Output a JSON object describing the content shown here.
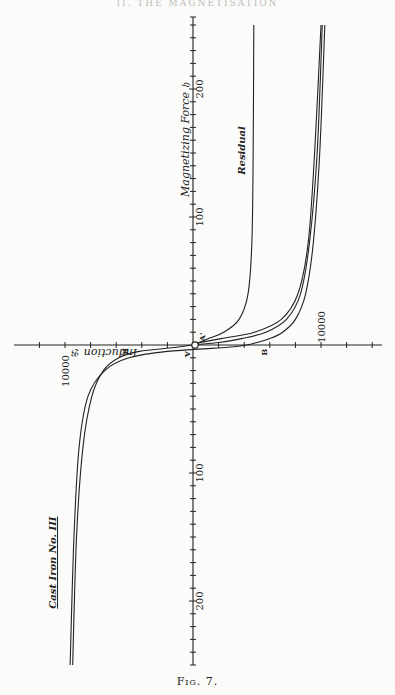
{
  "page": {
    "running_head": "II. THE MAGNETISATION",
    "caption": "Fig. 7."
  },
  "chart_data": {
    "type": "line",
    "title": "Cast Iron No. III",
    "xlabel": "Induction 𝔅",
    "ylabel": "Magnetizing Force 𝔥",
    "orientation": "rotated 90°: magnetizing force runs along the vertical axis (positive upward), induction along the horizontal axis (positive to the right)",
    "x_axis": {
      "name": "Induction 𝔅",
      "range": [
        -14000,
        14000
      ],
      "tick_step": 2000,
      "tick_labels": [
        {
          "value": -10000,
          "text": "10000"
        },
        {
          "value": 10000,
          "text": "10000"
        }
      ]
    },
    "y_axis": {
      "name": "Magnetizing Force 𝔥",
      "range": [
        -250,
        255
      ],
      "tick_step": 10,
      "tick_labels": [
        {
          "value": 200,
          "text": "200"
        },
        {
          "value": 100,
          "text": "100"
        },
        {
          "value": -100,
          "text": "100"
        },
        {
          "value": -200,
          "text": "200"
        }
      ]
    },
    "point_labels": [
      {
        "text": "A",
        "h": -2,
        "b": 0
      },
      {
        "text": "A'",
        "h": 2,
        "b": 0
      },
      {
        "text": "B",
        "h": 0,
        "b": -5600
      },
      {
        "text": "B",
        "h": 0,
        "b": 5600
      },
      {
        "text": "O",
        "h": 0,
        "b": 0
      }
    ],
    "series": [
      {
        "name": "Hysteresis loop (ascending branch)",
        "points": [
          [
            -250,
            -9400
          ],
          [
            -150,
            -9100
          ],
          [
            -80,
            -8600
          ],
          [
            -40,
            -7900
          ],
          [
            -20,
            -7000
          ],
          [
            -10,
            -5800
          ],
          [
            -5,
            -4200
          ],
          [
            -2,
            -1500
          ],
          [
            0,
            0
          ],
          [
            2,
            2000
          ],
          [
            5,
            3800
          ],
          [
            10,
            5700
          ],
          [
            20,
            7300
          ],
          [
            40,
            8400
          ],
          [
            80,
            9100
          ],
          [
            150,
            9700
          ],
          [
            250,
            10100
          ]
        ]
      },
      {
        "name": "Hysteresis loop (descending branch)",
        "points": [
          [
            250,
            10300
          ],
          [
            150,
            9900
          ],
          [
            80,
            9400
          ],
          [
            40,
            8800
          ],
          [
            20,
            8000
          ],
          [
            10,
            7000
          ],
          [
            5,
            6000
          ],
          [
            2,
            5000
          ],
          [
            0,
            4200
          ],
          [
            -2,
            2500
          ],
          [
            -5,
            -2000
          ],
          [
            -10,
            -5000
          ],
          [
            -20,
            -6900
          ],
          [
            -40,
            -8200
          ],
          [
            -80,
            -8900
          ],
          [
            -150,
            -9300
          ],
          [
            -250,
            -9600
          ]
        ]
      },
      {
        "name": "Initial magnetization curve",
        "points": [
          [
            0,
            0
          ],
          [
            2,
            600
          ],
          [
            5,
            2200
          ],
          [
            10,
            4800
          ],
          [
            20,
            6900
          ],
          [
            40,
            8200
          ],
          [
            80,
            9000
          ],
          [
            150,
            9500
          ],
          [
            250,
            10000
          ]
        ]
      },
      {
        "name": "Residual",
        "points": [
          [
            0,
            0
          ],
          [
            5,
            1200
          ],
          [
            10,
            2400
          ],
          [
            20,
            3600
          ],
          [
            40,
            4300
          ],
          [
            80,
            4600
          ],
          [
            150,
            4700
          ],
          [
            250,
            4750
          ]
        ]
      }
    ],
    "annotations": [
      {
        "text": "Residual",
        "near": "residual curve, h≈130"
      },
      {
        "text": "Cast Iron No. III",
        "near": "lower-left quadrant"
      }
    ],
    "grid": false,
    "legend": "none"
  }
}
